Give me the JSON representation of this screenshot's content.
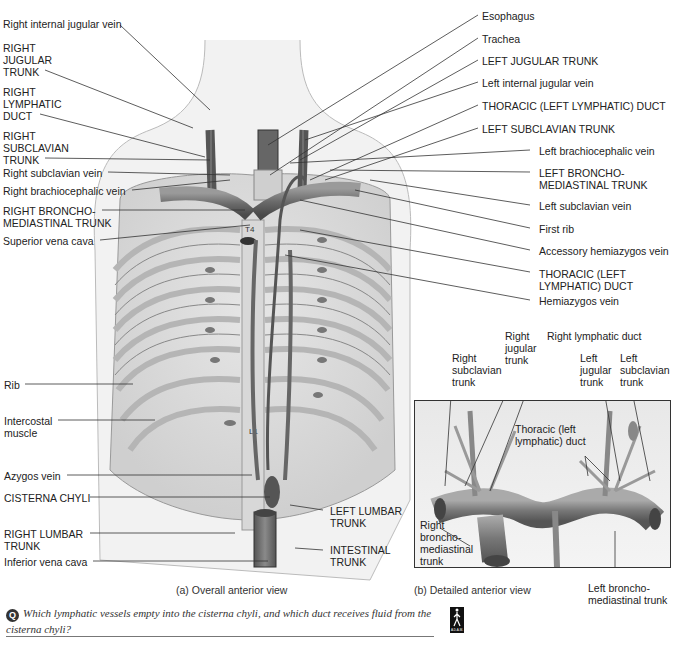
{
  "figure": {
    "part_a_caption": "(a) Overall anterior view",
    "part_b_caption": "(b) Detailed anterior view",
    "vertebra_labels": {
      "t4": "T4",
      "l1": "L1"
    },
    "artist_signature": "Ellis"
  },
  "labels_left": [
    {
      "id": "right-internal-jugular-vein",
      "text": "Right internal jugular vein"
    },
    {
      "id": "right-jugular-trunk",
      "text": "RIGHT\nJUGULAR\nTRUNK"
    },
    {
      "id": "right-lymphatic-duct",
      "text": "RIGHT\nLYMPHATIC\nDUCT"
    },
    {
      "id": "right-subclavian-trunk",
      "text": "RIGHT\nSUBCLAVIAN\nTRUNK"
    },
    {
      "id": "right-subclavian-vein",
      "text": "Right subclavian vein"
    },
    {
      "id": "right-brachiocephalic-vein",
      "text": "Right brachiocephalic vein"
    },
    {
      "id": "right-bronchomediastinal-trunk",
      "text": "RIGHT BRONCHO-\nMEDIASTINAL TRUNK"
    },
    {
      "id": "superior-vena-cava",
      "text": "Superior vena cava"
    },
    {
      "id": "rib",
      "text": "Rib"
    },
    {
      "id": "intercostal-muscle",
      "text": "Intercostal\nmuscle"
    },
    {
      "id": "azygos-vein",
      "text": "Azygos vein"
    },
    {
      "id": "cisterna-chyli",
      "text": "CISTERNA CHYLI"
    },
    {
      "id": "right-lumbar-trunk",
      "text": "RIGHT LUMBAR\nTRUNK"
    },
    {
      "id": "inferior-vena-cava",
      "text": "Inferior vena cava"
    }
  ],
  "labels_right": [
    {
      "id": "esophagus",
      "text": "Esophagus"
    },
    {
      "id": "trachea",
      "text": "Trachea"
    },
    {
      "id": "left-jugular-trunk",
      "text": "LEFT JUGULAR TRUNK"
    },
    {
      "id": "left-internal-jugular-vein",
      "text": "Left internal jugular vein"
    },
    {
      "id": "thoracic-duct-top",
      "text": "THORACIC (LEFT LYMPHATIC) DUCT"
    },
    {
      "id": "left-subclavian-trunk",
      "text": "LEFT SUBCLAVIAN TRUNK"
    },
    {
      "id": "left-brachiocephalic-vein",
      "text": "Left brachiocephalic vein"
    },
    {
      "id": "left-bronchomediastinal-trunk",
      "text": "LEFT BRONCHO-\nMEDIASTINAL TRUNK"
    },
    {
      "id": "left-subclavian-vein",
      "text": "Left subclavian vein"
    },
    {
      "id": "first-rib",
      "text": "First rib"
    },
    {
      "id": "accessory-hemiazygos-vein",
      "text": "Accessory hemiazygos vein"
    },
    {
      "id": "thoracic-duct-mid",
      "text": "THORACIC (LEFT\nLYMPHATIC) DUCT"
    },
    {
      "id": "hemiazygos-vein",
      "text": "Hemiazygos vein"
    }
  ],
  "labels_bottom_center": [
    {
      "id": "left-lumbar-trunk",
      "text": "LEFT LUMBAR\nTRUNK"
    },
    {
      "id": "intestinal-trunk",
      "text": "INTESTINAL\nTRUNK"
    }
  ],
  "inset_labels": [
    {
      "id": "inset-right-subclavian-trunk",
      "text": "Right\nsubclavian\ntrunk"
    },
    {
      "id": "inset-right-jugular-trunk",
      "text": "Right\njugular\ntrunk"
    },
    {
      "id": "inset-right-lymphatic-duct",
      "text": "Right lymphatic duct"
    },
    {
      "id": "inset-left-jugular-trunk",
      "text": "Left\njugular\ntrunk"
    },
    {
      "id": "inset-left-subclavian-trunk",
      "text": "Left\nsubclavian\ntrunk"
    },
    {
      "id": "inset-thoracic-duct",
      "text": "Thoracic (left\nlymphatic) duct"
    },
    {
      "id": "inset-right-bronchomediastinal-trunk",
      "text": "Right\nbroncho-\nmediastinal\ntrunk"
    },
    {
      "id": "inset-left-bronchomediastinal-trunk",
      "text": "Left broncho-\nmediastinal trunk"
    }
  ],
  "question": {
    "icon": "Q",
    "text": "Which lymphatic vessels empty into the cisterna chyli, and which duct receives fluid from the cisterna chyli?"
  },
  "logo": {
    "text": "A.D.A.M."
  }
}
